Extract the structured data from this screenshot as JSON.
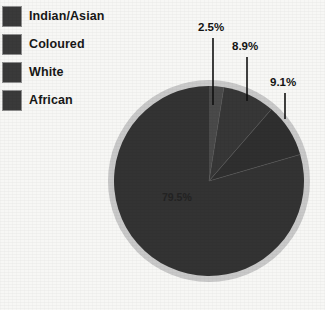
{
  "chart_data": {
    "type": "pie",
    "title": "",
    "categories": [
      "Indian/Asian",
      "Coloured",
      "White",
      "African"
    ],
    "values": [
      2.5,
      8.9,
      9.1,
      79.5
    ],
    "value_labels": [
      "2.5%",
      "8.9%",
      "9.1%",
      "79.5%"
    ],
    "units": "percent",
    "legend_position": "top-left",
    "grid": false,
    "colors": {
      "indian_asian": "#4a4a4a",
      "coloured": "#333333",
      "white": "#2f2f2f",
      "african": "#333333",
      "ring": "#c9c9c9",
      "background": "#f7f7f5",
      "legend_swatch": "#3a3a3a",
      "leader_line": "#111111",
      "text": "#171717"
    }
  },
  "legend": {
    "items": [
      {
        "label": "Indian/Asian",
        "swatch_name": "legend-swatch-indian-asian"
      },
      {
        "label": "Coloured",
        "swatch_name": "legend-swatch-coloured"
      },
      {
        "label": "White",
        "swatch_name": "legend-swatch-white"
      },
      {
        "label": "African",
        "swatch_name": "legend-swatch-african"
      }
    ]
  },
  "labels": {
    "indian_asian": "2.5%",
    "coloured": "8.9%",
    "white": "9.1%",
    "african": "79.5%"
  }
}
